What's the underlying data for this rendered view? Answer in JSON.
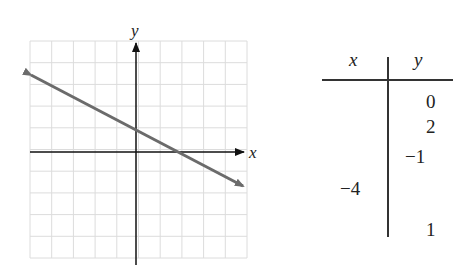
{
  "chart_data": {
    "type": "line",
    "title": "",
    "xlabel": "x",
    "ylabel": "y",
    "xlim": [
      -5,
      5
    ],
    "ylim": [
      -5,
      5
    ],
    "grid": true,
    "series": [
      {
        "name": "line",
        "equation": "y = -x/2 + 1",
        "x": [
          -5,
          0,
          2,
          5
        ],
        "y": [
          3.5,
          1,
          0,
          -1.5
        ]
      }
    ],
    "annotations": [
      "arrow on both ends of line",
      "axis arrows on positive x and y"
    ]
  },
  "graph": {
    "x_axis_label": "x",
    "y_axis_label": "y",
    "line_color": "#6b6b6b",
    "grid_color": "#dcdcdc",
    "axis_color": "#111111"
  },
  "table": {
    "headers": {
      "x": "x",
      "y": "y"
    },
    "rows": [
      {
        "x": "",
        "y": "0"
      },
      {
        "x": "",
        "y": "2"
      },
      {
        "x": "",
        "y": "−1"
      },
      {
        "x": "−4",
        "y": ""
      },
      {
        "x": "",
        "y": "1"
      }
    ]
  }
}
